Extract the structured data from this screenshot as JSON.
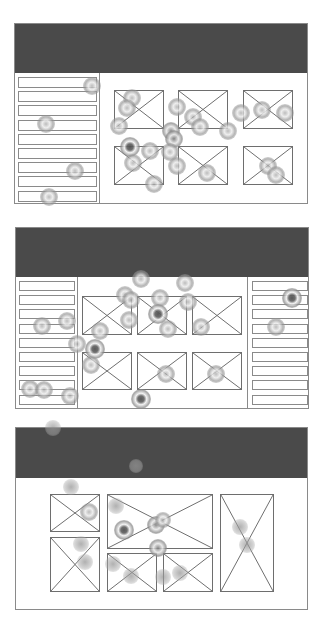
{
  "colors": {
    "header": "#4a4a4a",
    "border": "#8a8a8a",
    "box_border": "#6e6e6e",
    "background": "#ffffff"
  },
  "panels": [
    {
      "name": "layout-1-sidebar-grid",
      "x": 14,
      "y": 23,
      "w": 294,
      "h": 181,
      "header_h": 49,
      "sidebars": [
        {
          "side": "left",
          "x": 0,
          "w": 85,
          "row_x": 3,
          "row_w": 79,
          "row_y0": 53,
          "row_h": 11,
          "row_step": 14.2,
          "rows": 9
        }
      ],
      "boxes": [
        {
          "x": 99,
          "y": 66,
          "w": 50,
          "h": 39
        },
        {
          "x": 163,
          "y": 66,
          "w": 50,
          "h": 39
        },
        {
          "x": 228,
          "y": 66,
          "w": 50,
          "h": 39
        },
        {
          "x": 99,
          "y": 122,
          "w": 50,
          "h": 39
        },
        {
          "x": 163,
          "y": 122,
          "w": 50,
          "h": 39
        },
        {
          "x": 228,
          "y": 122,
          "w": 50,
          "h": 39
        }
      ]
    },
    {
      "name": "layout-2-two-sidebars",
      "x": 15,
      "y": 227,
      "w": 294,
      "h": 182,
      "header_h": 49,
      "sidebars": [
        {
          "side": "left",
          "x": 0,
          "w": 62,
          "row_x": 3,
          "row_w": 56,
          "row_y0": 53,
          "row_h": 10,
          "row_step": 14.2,
          "rows": 9
        },
        {
          "side": "right",
          "x": 231,
          "w": 63,
          "row_x": 4,
          "row_w": 56,
          "row_y0": 53,
          "row_h": 10,
          "row_step": 14.2,
          "rows": 9
        }
      ],
      "boxes": [
        {
          "x": 66,
          "y": 68,
          "w": 50,
          "h": 39
        },
        {
          "x": 121,
          "y": 68,
          "w": 50,
          "h": 39
        },
        {
          "x": 176,
          "y": 68,
          "w": 50,
          "h": 39
        },
        {
          "x": 66,
          "y": 124,
          "w": 50,
          "h": 38
        },
        {
          "x": 121,
          "y": 124,
          "w": 50,
          "h": 38
        },
        {
          "x": 176,
          "y": 124,
          "w": 50,
          "h": 38
        }
      ]
    },
    {
      "name": "layout-3-mixed-grid",
      "x": 15,
      "y": 427,
      "w": 293,
      "h": 183,
      "header_h": 50,
      "sidebars": [],
      "boxes": [
        {
          "x": 34,
          "y": 66,
          "w": 50,
          "h": 38
        },
        {
          "x": 34,
          "y": 109,
          "w": 50,
          "h": 55
        },
        {
          "x": 91,
          "y": 66,
          "w": 106,
          "h": 55
        },
        {
          "x": 91,
          "y": 125,
          "w": 50,
          "h": 39
        },
        {
          "x": 147,
          "y": 125,
          "w": 50,
          "h": 39
        },
        {
          "x": 204,
          "y": 66,
          "w": 54,
          "h": 98
        }
      ]
    }
  ],
  "heat_spots": [
    {
      "x": 92,
      "y": 86,
      "r": 9,
      "i": 1
    },
    {
      "x": 46,
      "y": 124,
      "r": 9,
      "i": 1
    },
    {
      "x": 75,
      "y": 171,
      "r": 9,
      "i": 1
    },
    {
      "x": 49,
      "y": 197,
      "r": 9,
      "i": 1
    },
    {
      "x": 132,
      "y": 98,
      "r": 9,
      "i": 1
    },
    {
      "x": 127,
      "y": 108,
      "r": 9,
      "i": 1
    },
    {
      "x": 119,
      "y": 126,
      "r": 9,
      "i": 1
    },
    {
      "x": 130,
      "y": 147,
      "r": 10,
      "i": 3
    },
    {
      "x": 133,
      "y": 163,
      "r": 9,
      "i": 1
    },
    {
      "x": 150,
      "y": 151,
      "r": 9,
      "i": 1
    },
    {
      "x": 154,
      "y": 184,
      "r": 9,
      "i": 1
    },
    {
      "x": 177,
      "y": 107,
      "r": 9,
      "i": 1
    },
    {
      "x": 193,
      "y": 117,
      "r": 9,
      "i": 1
    },
    {
      "x": 200,
      "y": 127,
      "r": 9,
      "i": 1
    },
    {
      "x": 171,
      "y": 131,
      "r": 9,
      "i": 2
    },
    {
      "x": 174,
      "y": 139,
      "r": 9,
      "i": 2
    },
    {
      "x": 170,
      "y": 152,
      "r": 9,
      "i": 1
    },
    {
      "x": 177,
      "y": 166,
      "r": 9,
      "i": 1
    },
    {
      "x": 207,
      "y": 173,
      "r": 9,
      "i": 1
    },
    {
      "x": 228,
      "y": 131,
      "r": 9,
      "i": 1
    },
    {
      "x": 241,
      "y": 113,
      "r": 9,
      "i": 1
    },
    {
      "x": 262,
      "y": 110,
      "r": 9,
      "i": 1
    },
    {
      "x": 285,
      "y": 113,
      "r": 9,
      "i": 1
    },
    {
      "x": 268,
      "y": 166,
      "r": 9,
      "i": 1
    },
    {
      "x": 276,
      "y": 175,
      "r": 9,
      "i": 1
    },
    {
      "x": 141,
      "y": 279,
      "r": 9,
      "i": 1
    },
    {
      "x": 125,
      "y": 295,
      "r": 9,
      "i": 1
    },
    {
      "x": 131,
      "y": 300,
      "r": 9,
      "i": 1
    },
    {
      "x": 129,
      "y": 320,
      "r": 9,
      "i": 1
    },
    {
      "x": 160,
      "y": 298,
      "r": 9,
      "i": 1
    },
    {
      "x": 158,
      "y": 314,
      "r": 10,
      "i": 3
    },
    {
      "x": 168,
      "y": 329,
      "r": 9,
      "i": 1
    },
    {
      "x": 185,
      "y": 283,
      "r": 9,
      "i": 1
    },
    {
      "x": 188,
      "y": 302,
      "r": 9,
      "i": 1
    },
    {
      "x": 201,
      "y": 327,
      "r": 9,
      "i": 1
    },
    {
      "x": 42,
      "y": 326,
      "r": 9,
      "i": 1
    },
    {
      "x": 67,
      "y": 321,
      "r": 9,
      "i": 1
    },
    {
      "x": 100,
      "y": 331,
      "r": 9,
      "i": 1
    },
    {
      "x": 77,
      "y": 344,
      "r": 9,
      "i": 1
    },
    {
      "x": 95,
      "y": 349,
      "r": 10,
      "i": 3
    },
    {
      "x": 91,
      "y": 365,
      "r": 9,
      "i": 1
    },
    {
      "x": 30,
      "y": 389,
      "r": 9,
      "i": 1
    },
    {
      "x": 44,
      "y": 390,
      "r": 9,
      "i": 1
    },
    {
      "x": 70,
      "y": 396,
      "r": 9,
      "i": 1
    },
    {
      "x": 141,
      "y": 399,
      "r": 10,
      "i": 3
    },
    {
      "x": 166,
      "y": 374,
      "r": 9,
      "i": 1
    },
    {
      "x": 216,
      "y": 374,
      "r": 9,
      "i": 1
    },
    {
      "x": 292,
      "y": 298,
      "r": 10,
      "i": 3
    },
    {
      "x": 276,
      "y": 327,
      "r": 9,
      "i": 1
    },
    {
      "x": 53,
      "y": 428,
      "r": 8,
      "i": 0
    },
    {
      "x": 136,
      "y": 466,
      "r": 7,
      "i": 0
    },
    {
      "x": 71,
      "y": 487,
      "r": 8,
      "i": 0
    },
    {
      "x": 89,
      "y": 512,
      "r": 9,
      "i": 1
    },
    {
      "x": 116,
      "y": 506,
      "r": 8,
      "i": 0
    },
    {
      "x": 124,
      "y": 530,
      "r": 10,
      "i": 3
    },
    {
      "x": 156,
      "y": 525,
      "r": 9,
      "i": 2
    },
    {
      "x": 163,
      "y": 520,
      "r": 8,
      "i": 1
    },
    {
      "x": 158,
      "y": 548,
      "r": 9,
      "i": 2
    },
    {
      "x": 81,
      "y": 544,
      "r": 8,
      "i": 0
    },
    {
      "x": 85,
      "y": 562,
      "r": 8,
      "i": 0
    },
    {
      "x": 113,
      "y": 564,
      "r": 8,
      "i": 0
    },
    {
      "x": 131,
      "y": 576,
      "r": 8,
      "i": 0
    },
    {
      "x": 163,
      "y": 577,
      "r": 8,
      "i": 0
    },
    {
      "x": 180,
      "y": 573,
      "r": 8,
      "i": 0
    },
    {
      "x": 240,
      "y": 527,
      "r": 8,
      "i": 0
    },
    {
      "x": 247,
      "y": 545,
      "r": 8,
      "i": 0
    }
  ]
}
